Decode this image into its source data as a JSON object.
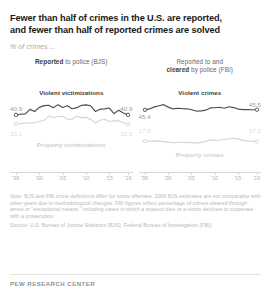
{
  "header": {
    "title_line1": "Fewer than half of crimes in the U.S. are reported,",
    "title_line2": "and fewer than half of reported crimes are solved",
    "subtitle": "% of crimes ..."
  },
  "panels": {
    "left": {
      "head_bold": "Reported",
      "head_rest": " to police (BJS)",
      "head_line1": "",
      "series_violent_label": "Violent victimizations",
      "series_property_label": "Property victimizations",
      "violent_start": "40.9",
      "violent_end": "40.9",
      "property_start": "33.1",
      "property_end": "32.5"
    },
    "right": {
      "head_line1": "Reported to and",
      "head_bold": "cleared",
      "head_rest": " by police (FBI)",
      "series_violent_label": "Violent crimes",
      "series_property_label": "Property crimes",
      "violent_start": "45.4",
      "violent_end": "45.5",
      "property_start": "17.6",
      "property_end": "17.2"
    }
  },
  "axis_ticks": [
    "'95",
    "'00",
    "'05",
    "'10",
    "'15",
    "'19"
  ],
  "notes": {
    "note": "Note: BJS and FBI crime definitions differ for some offenses. 2006 BJS estimates are not comparable with other years due to methodological changes. FBI figures reflect percentage of crimes cleared through arrest or “exceptional means,” including cases in which a suspect dies or a victim declines to cooperate with a prosecution.",
    "source": "Source: U.S. Bureau of Justice Statistics (BJS), Federal Bureau of Investigation (FBI)."
  },
  "footer": "PEW RESEARCH CENTER",
  "colors": {
    "dark_line": "#4d4d4d",
    "light_line": "#d5d5d5",
    "title": "#1a1a1a",
    "muted": "#b8b8b8"
  },
  "chart_data": {
    "type": "line",
    "title": "Fewer than half of crimes in the U.S. are reported, and fewer than half of reported crimes are solved",
    "subtitle": "% of crimes ...",
    "xlabel": "",
    "ylabel": "% of crimes",
    "ylim": [
      0,
      55
    ],
    "grid": false,
    "legend": "inline-labels",
    "x": [
      1995,
      1996,
      1997,
      1998,
      1999,
      2000,
      2001,
      2002,
      2003,
      2004,
      2005,
      2006,
      2007,
      2008,
      2009,
      2010,
      2011,
      2012,
      2013,
      2014,
      2015,
      2016,
      2017,
      2018,
      2019
    ],
    "panels": [
      {
        "name": "Reported to police (BJS)",
        "series": [
          {
            "name": "Violent victimizations",
            "style": "dark",
            "start_label": "40.9",
            "end_label": "40.9",
            "values": [
              40.9,
              41.5,
              41.8,
              45.8,
              43.9,
              47.6,
              49.1,
              49.5,
              47.2,
              50.0,
              47.4,
              49.0,
              46.4,
              47.3,
              49.3,
              49.8,
              49.0,
              44.0,
              46.0,
              46.2,
              47.0,
              42.0,
              45.0,
              42.6,
              40.9
            ]
          },
          {
            "name": "Property victimizations",
            "style": "light",
            "start_label": "33.1",
            "end_label": "32.5",
            "values": [
              33.1,
              33.0,
              33.6,
              33.7,
              34.0,
              35.0,
              36.1,
              39.8,
              38.6,
              39.3,
              39.7,
              37.0,
              37.1,
              39.9,
              38.5,
              38.7,
              36.9,
              33.8,
              36.1,
              37.0,
              35.0,
              35.7,
              35.6,
              34.0,
              32.5
            ]
          }
        ]
      },
      {
        "name": "Reported to and cleared by police (FBI)",
        "series": [
          {
            "name": "Violent crimes",
            "style": "dark",
            "start_label": "45.4",
            "end_label": "45.5",
            "values": [
              45.4,
              46.2,
              48.0,
              49.0,
              50.0,
              47.8,
              46.2,
              46.8,
              46.5,
              46.3,
              45.5,
              44.3,
              44.5,
              45.1,
              47.1,
              47.2,
              47.7,
              46.8,
              48.1,
              47.4,
              46.0,
              45.6,
              45.6,
              45.5,
              45.5
            ]
          },
          {
            "name": "Property crimes",
            "style": "light",
            "start_label": "17.6",
            "end_label": "17.2",
            "values": [
              17.6,
              17.5,
              17.8,
              17.6,
              17.2,
              16.7,
              16.2,
              16.5,
              16.4,
              16.5,
              16.3,
              15.8,
              16.5,
              17.4,
              18.6,
              18.3,
              18.6,
              19.0,
              19.7,
              20.2,
              19.4,
              18.3,
              17.8,
              17.6,
              17.2
            ]
          }
        ]
      }
    ]
  }
}
